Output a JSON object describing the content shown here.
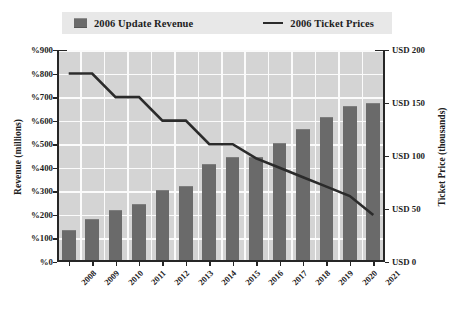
{
  "legend": {
    "entries": [
      {
        "label": "2006 Update Revenue",
        "marker": "bar-swatch",
        "color": "#6a6a6a"
      },
      {
        "label": "2006 Ticket Prices",
        "marker": "line-swatch",
        "color": "#2b2b2b"
      }
    ]
  },
  "chart_data": {
    "type": "bar",
    "title": "",
    "categories": [
      "2008",
      "2009",
      "2010",
      "2011",
      "2012",
      "2013",
      "2014",
      "2015",
      "2016",
      "2017",
      "2018",
      "2019",
      "2020",
      "2021"
    ],
    "series": [
      {
        "name": "2006 Update Revenue",
        "type": "bar",
        "axis": "left",
        "color": "#6a6a6a",
        "values": [
          130,
          180,
          215,
          240,
          300,
          320,
          410,
          440,
          440,
          500,
          560,
          610,
          660,
          670
        ]
      },
      {
        "name": "2006 Ticket Prices",
        "type": "line",
        "axis": "right",
        "color": "#2b2b2b",
        "values": [
          200,
          200,
          175,
          175,
          150,
          150,
          125,
          125,
          110,
          100,
          90,
          80,
          70,
          50
        ]
      }
    ],
    "xlabel": "",
    "ylabel": "Revenue (millions)",
    "y2label": "Ticket Price (thousands)",
    "ylim": [
      0,
      900
    ],
    "y2lim": [
      0,
      225
    ],
    "yticks": [
      "%0",
      "%100",
      "%200",
      "%300",
      "%400",
      "%500",
      "%600",
      "%700",
      "%800",
      "%900"
    ],
    "y2ticks": [
      "USD 0",
      "USD 50",
      "USD 100",
      "USD 150",
      "USD 200"
    ],
    "grid": true,
    "legend_position": "top"
  }
}
